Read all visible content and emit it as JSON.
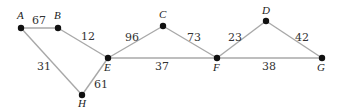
{
  "diagram": {
    "type": "weighted-graph",
    "nodes": [
      {
        "id": "A",
        "label": "A",
        "x": 21,
        "y": 28,
        "lx": 17,
        "ly": 19
      },
      {
        "id": "B",
        "label": "B",
        "x": 58,
        "y": 28,
        "lx": 54,
        "ly": 19
      },
      {
        "id": "C",
        "label": "C",
        "x": 163,
        "y": 26,
        "lx": 159,
        "ly": 18
      },
      {
        "id": "D",
        "label": "D",
        "x": 266,
        "y": 21,
        "lx": 262,
        "ly": 14
      },
      {
        "id": "E",
        "label": "E",
        "x": 108,
        "y": 58,
        "lx": 104,
        "ly": 71
      },
      {
        "id": "F",
        "label": "F",
        "x": 217,
        "y": 58,
        "lx": 213,
        "ly": 71
      },
      {
        "id": "G",
        "label": "G",
        "x": 322,
        "y": 58,
        "lx": 317,
        "ly": 71
      },
      {
        "id": "H",
        "label": "H",
        "x": 82,
        "y": 95,
        "lx": 78,
        "ly": 107
      }
    ],
    "edges": [
      {
        "from": "A",
        "to": "B",
        "weight": "67",
        "lx": 32,
        "ly": 24
      },
      {
        "from": "B",
        "to": "E",
        "weight": "12",
        "lx": 81,
        "ly": 40
      },
      {
        "from": "A",
        "to": "H",
        "weight": "31",
        "lx": 37,
        "ly": 70
      },
      {
        "from": "E",
        "to": "H",
        "weight": "61",
        "lx": 94,
        "ly": 88
      },
      {
        "from": "E",
        "to": "C",
        "weight": "96",
        "lx": 125,
        "ly": 41
      },
      {
        "from": "E",
        "to": "F",
        "weight": "37",
        "lx": 155,
        "ly": 70
      },
      {
        "from": "C",
        "to": "F",
        "weight": "73",
        "lx": 187,
        "ly": 41
      },
      {
        "from": "F",
        "to": "D",
        "weight": "23",
        "lx": 228,
        "ly": 41
      },
      {
        "from": "D",
        "to": "G",
        "weight": "42",
        "lx": 295,
        "ly": 41
      },
      {
        "from": "F",
        "to": "G",
        "weight": "38",
        "lx": 262,
        "ly": 70
      }
    ]
  }
}
